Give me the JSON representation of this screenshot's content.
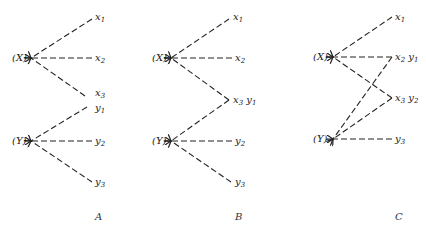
{
  "panels": [
    {
      "caption": "A",
      "nodes": {
        "X": "(X)",
        "Y": "(Y)"
      },
      "targets": [
        "x1",
        "x2",
        "x3",
        "y1",
        "y2",
        "y3"
      ],
      "labels": {
        "x1": "x",
        "x1s": "1",
        "x2": "x",
        "x2s": "2",
        "x3": "x",
        "x3s": "3",
        "y1": "y",
        "y1s": "1",
        "y2": "y",
        "y2s": "2",
        "y3": "y",
        "y3s": "3"
      }
    },
    {
      "caption": "B",
      "nodes": {
        "X": "(X)",
        "Y": "(Y)"
      },
      "targets": [
        "x1",
        "x2",
        "x3 y1",
        "y2",
        "y3"
      ],
      "labels": {
        "x1": "x",
        "x1s": "1",
        "x2": "x",
        "x2s": "2",
        "x3": "x",
        "x3s": "3",
        "y1": "y",
        "y1s": "1",
        "y2": "y",
        "y2s": "2",
        "y3": "y",
        "y3s": "3"
      }
    },
    {
      "caption": "C",
      "nodes": {
        "X": "(X)",
        "Y": "(Y)"
      },
      "targets": [
        "x1",
        "x2 y1",
        "x3 y2",
        "y3"
      ],
      "labels": {
        "x1": "x",
        "x1s": "1",
        "x2": "x",
        "x2s": "2",
        "x3": "x",
        "x3s": "3",
        "y1": "y",
        "y1s": "1",
        "y2": "y",
        "y2s": "2",
        "y3": "y",
        "y3s": "3"
      }
    }
  ]
}
